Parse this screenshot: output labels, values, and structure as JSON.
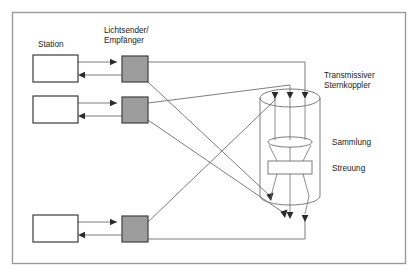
{
  "figure": {
    "kind": "optical-network-diagram",
    "language": "de",
    "frame": {
      "border_color": "#9a9a9a",
      "background": "#ffffff"
    }
  },
  "labels": {
    "station": "Station",
    "transceiver_line1": "Lichtsender/",
    "transceiver_line2": "Empfänger",
    "star_coupler_line1": "Transmissiver",
    "star_coupler_line2": "Sternkoppler",
    "collection": "Sammlung",
    "scattering": "Streuung"
  },
  "colors": {
    "line": "#6e6e6e",
    "dark_line": "#3a3a3a",
    "transceiver_fill": "#9d9d9d",
    "transceiver_stroke": "#404040",
    "station_fill": "#ffffff",
    "station_stroke": "#3a3a3a",
    "coupler_stroke": "#6e6e6e",
    "text": "#1a1a1a"
  },
  "stations": [
    {
      "id": "station-1",
      "x": 33,
      "y": 55,
      "w": 45,
      "h": 27
    },
    {
      "id": "station-2",
      "x": 33,
      "y": 96,
      "w": 45,
      "h": 27
    },
    {
      "id": "station-3",
      "x": 33,
      "y": 215,
      "w": 45,
      "h": 27
    }
  ],
  "transceivers": [
    {
      "id": "transceiver-1",
      "x": 122,
      "y": 56,
      "w": 26,
      "h": 26
    },
    {
      "id": "transceiver-2",
      "x": 122,
      "y": 97,
      "w": 26,
      "h": 26
    },
    {
      "id": "transceiver-3",
      "x": 122,
      "y": 216,
      "w": 26,
      "h": 26
    }
  ],
  "star_coupler": {
    "cx": 290,
    "top_y": 98,
    "bottom_y": 196,
    "rx": 30,
    "ry": 9,
    "lens": {
      "label_ref": "collection",
      "cy": 143,
      "rx": 22,
      "ry": 5
    },
    "block": {
      "label_ref": "scattering",
      "x": 268,
      "y": 161,
      "w": 44,
      "h": 13
    }
  },
  "input_arrow_x": [
    275,
    290,
    305
  ],
  "output_ray_x": [
    275,
    290,
    305
  ],
  "label_positions": {
    "station": {
      "x": 38,
      "y": 47
    },
    "transceiver": {
      "x": 104,
      "y": 35
    },
    "star_coupler": {
      "x": 322,
      "y": 80
    },
    "collection": {
      "x": 332,
      "y": 145
    },
    "scattering": {
      "x": 332,
      "y": 171
    }
  }
}
